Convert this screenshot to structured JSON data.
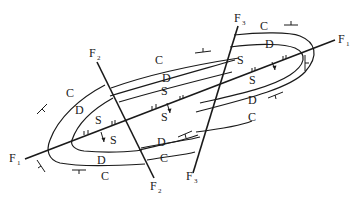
{
  "diagram": {
    "type": "geological-fold-fault-map",
    "faults": [
      {
        "id": "F1",
        "label": "F",
        "subscript": "1"
      },
      {
        "id": "F2",
        "label": "F",
        "subscript": "2"
      },
      {
        "id": "F3",
        "label": "F",
        "subscript": "3"
      }
    ],
    "strata": {
      "C": "C",
      "D": "D",
      "S": "S"
    },
    "colors": {
      "ink": "#1a1a1a",
      "background": "#ffffff"
    }
  }
}
